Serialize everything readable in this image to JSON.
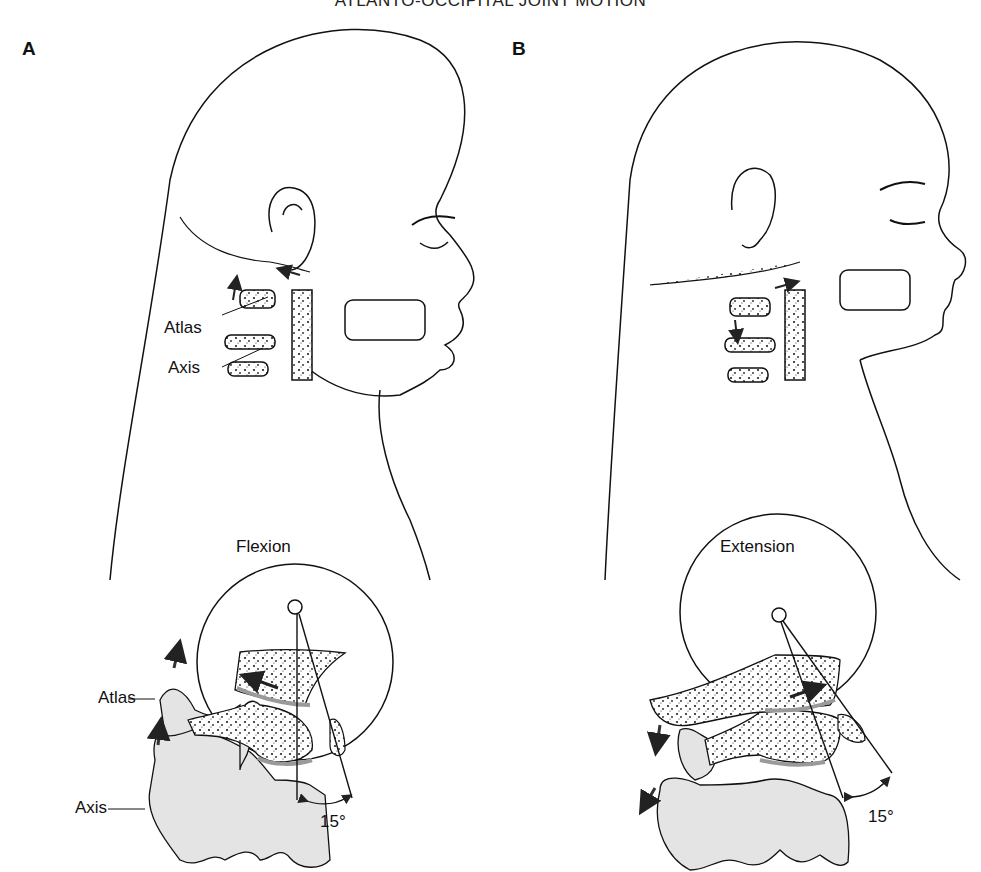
{
  "title": "ATLANTO-OCCIPITAL JOINT MOTION",
  "panels": [
    {
      "id": "A",
      "label": "A",
      "motion": "Flexion",
      "head_labels": {
        "atlas": "Atlas",
        "axis": "Axis"
      },
      "detail_labels": {
        "atlas": "Atlas",
        "axis": "Axis"
      },
      "angle": "15°",
      "arrow_direction": "up"
    },
    {
      "id": "B",
      "label": "B",
      "motion": "Extension",
      "angle": "15°",
      "arrow_direction": "down"
    }
  ],
  "colors": {
    "line": "#111111",
    "bone_fill": "#e4e4e4",
    "cartilage": "#9a9a9a",
    "background": "#ffffff"
  }
}
